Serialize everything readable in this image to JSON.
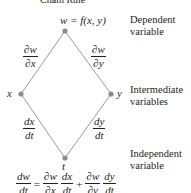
{
  "title": "Chain Rule",
  "nodes": {
    "top": {
      "label": "w = f(x, y)"
    },
    "left": {
      "label": "x"
    },
    "right": {
      "label": "y"
    },
    "bottom": {
      "label": "t"
    }
  },
  "edges": {
    "w_x": {
      "num": "∂w",
      "den": "∂x"
    },
    "w_y": {
      "num": "∂w",
      "den": "∂y"
    },
    "x_t": {
      "num": "dx",
      "den": "dt"
    },
    "y_t": {
      "num": "dy",
      "den": "dt"
    }
  },
  "side_labels": {
    "dependent": [
      "Dependent",
      "variable"
    ],
    "intermediate": [
      "Intermediate",
      "variables"
    ],
    "independent": [
      "Independent",
      "variable"
    ]
  },
  "formula": {
    "lhs": {
      "num": "dw",
      "den": "dt"
    },
    "eq": "=",
    "t1a": {
      "num": "∂w",
      "den": "∂x"
    },
    "t1b": {
      "num": "dx",
      "den": "dt"
    },
    "plus": "+",
    "t2a": {
      "num": "∂w",
      "den": "∂y"
    },
    "t2b": {
      "num": "dy",
      "den": "dt"
    }
  },
  "colors": {
    "line": "#9a9a9a",
    "node": "#8c8c8c",
    "text": "#231f20"
  }
}
